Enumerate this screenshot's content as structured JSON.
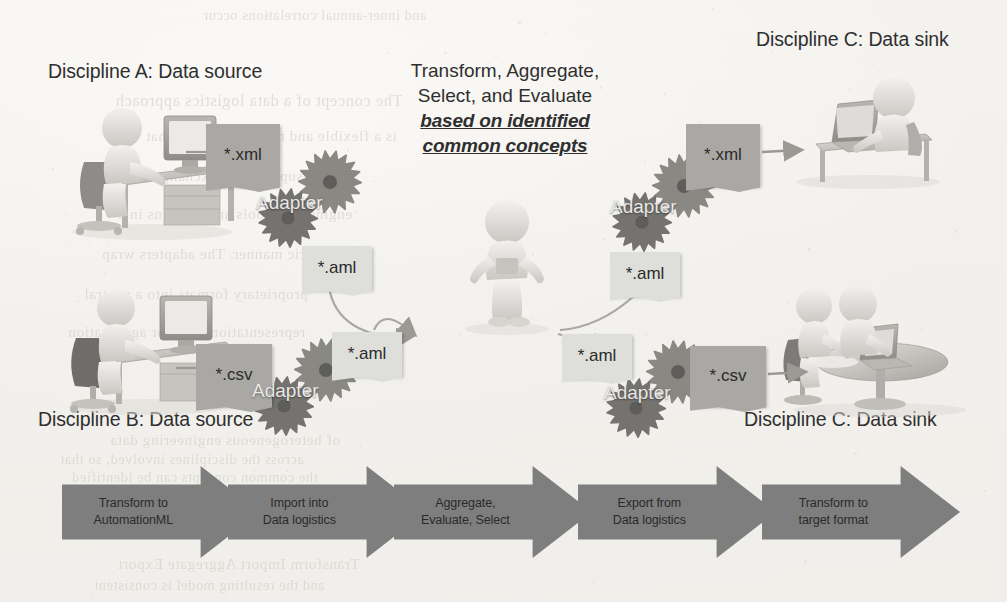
{
  "figure": {
    "headings": [
      {
        "id": "discipline-a",
        "text": "Discipline A: Data source",
        "x": 48,
        "y": 60
      },
      {
        "id": "discipline-b",
        "text": "Discipline B: Data source",
        "x": 38,
        "y": 408
      },
      {
        "id": "discipline-c-top",
        "text": "Discipline C: Data sink",
        "x": 756,
        "y": 28
      },
      {
        "id": "discipline-c-bottom",
        "text": "Discipline C: Data sink",
        "x": 744,
        "y": 408
      }
    ],
    "centre_caption": {
      "line1": "Transform,  Aggregate,",
      "line2": "Select, and Evaluate",
      "emphasis_line1": "based on identified",
      "emphasis_line2": "common concepts"
    },
    "documents": [
      {
        "id": "doc-a-xml",
        "label": "*.xml",
        "tone": "dark",
        "x": 206,
        "y": 124,
        "w": 74,
        "h": 62
      },
      {
        "id": "doc-a-aml",
        "label": "*.aml",
        "tone": "light",
        "x": 302,
        "y": 246,
        "w": 70,
        "h": 44
      },
      {
        "id": "doc-b-csv",
        "label": "*.csv",
        "tone": "dark",
        "x": 196,
        "y": 344,
        "w": 76,
        "h": 62
      },
      {
        "id": "doc-b-aml",
        "label": "*.aml",
        "tone": "light",
        "x": 332,
        "y": 332,
        "w": 70,
        "h": 44
      },
      {
        "id": "doc-c-aml-top",
        "label": "*.aml",
        "tone": "light",
        "x": 610,
        "y": 252,
        "w": 70,
        "h": 44
      },
      {
        "id": "doc-c-xml",
        "label": "*.xml",
        "tone": "dark",
        "x": 686,
        "y": 124,
        "w": 74,
        "h": 62
      },
      {
        "id": "doc-c-aml-bottom",
        "label": "*.aml",
        "tone": "light",
        "x": 562,
        "y": 334,
        "w": 70,
        "h": 44
      },
      {
        "id": "doc-c-csv",
        "label": "*.csv",
        "tone": "dark",
        "x": 690,
        "y": 346,
        "w": 76,
        "h": 60
      }
    ],
    "adapters": [
      {
        "id": "adapter-a",
        "label": "Adapter",
        "x": 244,
        "y": 148
      },
      {
        "id": "adapter-b",
        "label": "Adapter",
        "x": 240,
        "y": 336
      },
      {
        "id": "adapter-c-top",
        "label": "Adapter",
        "x": 598,
        "y": 152
      },
      {
        "id": "adapter-c-bottom",
        "label": "Adapter",
        "x": 592,
        "y": 338
      }
    ],
    "process_steps": [
      {
        "id": "step-transform-to-automationml",
        "line1": "Transform to",
        "line2": "AutomationML",
        "x": 62,
        "w": 198
      },
      {
        "id": "step-import-into-data-logistics",
        "line1": "Import into",
        "line2": "Data logistics",
        "x": 228,
        "w": 198
      },
      {
        "id": "step-aggregate-evaluate-select",
        "line1": "Aggregate,",
        "line2": "Evaluate, Select",
        "x": 394,
        "w": 198
      },
      {
        "id": "step-export-from-data-logistics",
        "line1": "Export from",
        "line2": "Data logistics",
        "x": 578,
        "w": 198
      },
      {
        "id": "step-transform-to-target-format",
        "line1": "Transform to",
        "line2": "target format",
        "x": 762,
        "w": 198
      }
    ],
    "ghost_text": [
      {
        "t": "and inner-annual correlations occur",
        "x": 205,
        "y": 8,
        "s": 14
      },
      {
        "t": "The concept of a data logistics approach",
        "x": 118,
        "y": 92,
        "s": 16
      },
      {
        "t": "is a flexible and modular method that",
        "x": 148,
        "y": 128,
        "s": 15
      },
      {
        "t": "supports the exchange between",
        "x": 96,
        "y": 168,
        "s": 15
      },
      {
        "t": "engineering tools and domains in a",
        "x": 120,
        "y": 206,
        "s": 15
      },
      {
        "t": "generic manner. The adapters wrap",
        "x": 104,
        "y": 246,
        "s": 15
      },
      {
        "t": "proprietary formats into a neutral",
        "x": 86,
        "y": 286,
        "s": 15
      },
      {
        "t": "representation used for aggregation",
        "x": 70,
        "y": 324,
        "s": 15
      },
      {
        "t": "of heterogeneous engineering data",
        "x": 112,
        "y": 432,
        "s": 15
      },
      {
        "t": "across the disciplines involved, so that",
        "x": 62,
        "y": 452,
        "s": 14
      },
      {
        "t": "the common concepts can be identified",
        "x": 74,
        "y": 470,
        "s": 14
      },
      {
        "t": "Transform  Import  Aggregate  Export",
        "x": 120,
        "y": 556,
        "s": 15
      },
      {
        "t": "and the resulting model is consistent",
        "x": 96,
        "y": 578,
        "s": 14
      }
    ]
  }
}
